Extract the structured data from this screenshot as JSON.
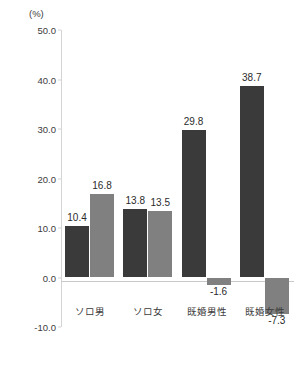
{
  "chart_data": {
    "type": "bar",
    "title": "",
    "unit_label": "(%)",
    "xlabel": "",
    "ylabel": "",
    "ylim": [
      -10.0,
      50.0
    ],
    "yticks": [
      "50.0",
      "40.0",
      "30.0",
      "20.0",
      "10.0",
      "0.0",
      "-10.0"
    ],
    "ytick_values": [
      50.0,
      40.0,
      30.0,
      20.0,
      10.0,
      0.0,
      -10.0
    ],
    "grid": false,
    "legend": "none",
    "categories": [
      "ソロ男",
      "ソロ女",
      "既婚男性",
      "既婚女性"
    ],
    "series": [
      {
        "name": "series-1",
        "color": "#3a3a3a",
        "values": [
          10.4,
          13.8,
          29.8,
          38.7
        ],
        "labels": [
          "10.4",
          "13.8",
          "29.8",
          "38.7"
        ]
      },
      {
        "name": "series-2",
        "color": "#808080",
        "values": [
          16.8,
          13.5,
          -1.6,
          -7.3
        ],
        "labels": [
          "16.8",
          "13.5",
          "-1.6",
          "-7.3"
        ]
      }
    ]
  },
  "colors": {
    "series_dark": "#3a3a3a",
    "series_gray": "#808080",
    "axis": "#d4d4d4",
    "text": "#3b3b3b"
  }
}
